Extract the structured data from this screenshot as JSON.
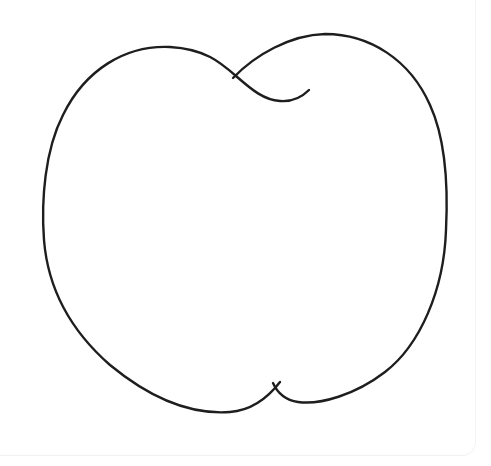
{
  "image": {
    "subject": "apple outline",
    "style": "black line drawing on white",
    "stroke_color": "#1e1e1e",
    "background_color": "#ffffff"
  },
  "drawing": {
    "title": "Apple outline coloring page"
  }
}
